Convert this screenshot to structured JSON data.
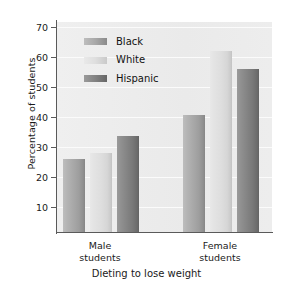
{
  "chart_data": {
    "type": "bar",
    "title": "",
    "xlabel": "Dieting to lose weight",
    "ylabel": "Percentage of students",
    "categories": [
      "Male students",
      "Female students"
    ],
    "category_lines": [
      [
        "Male",
        "students"
      ],
      [
        "Female",
        "students"
      ]
    ],
    "series": [
      {
        "name": "Black",
        "values": [
          25,
          40
        ],
        "color": "#a8a8a8"
      },
      {
        "name": "White",
        "values": [
          27,
          62
        ],
        "color": "#dedede"
      },
      {
        "name": "Hispanic",
        "values": [
          33,
          56
        ],
        "color": "#828282"
      }
    ],
    "ylim": [
      0,
      72
    ],
    "yticks": [
      10,
      20,
      30,
      40,
      50,
      60,
      70
    ],
    "ytick_labels": [
      "10",
      "20",
      "30",
      "40",
      "50",
      "60",
      "70"
    ],
    "grid": true,
    "grid_axis": "y",
    "legend_position": "upper-left-inside",
    "plot_background": "#ededed",
    "axis_color": "#5a5a5a"
  },
  "legend": {
    "items": [
      {
        "label": "Black"
      },
      {
        "label": "White"
      },
      {
        "label": "Hispanic"
      }
    ]
  },
  "axes": {
    "y_title": "Percentage of students",
    "x_title": "Dieting to lose weight",
    "y_ticks": [
      "70",
      "60",
      "50",
      "40",
      "30",
      "20",
      "10"
    ]
  },
  "x_groups": [
    {
      "line1": "Male",
      "line2": "students"
    },
    {
      "line1": "Female",
      "line2": "students"
    }
  ]
}
